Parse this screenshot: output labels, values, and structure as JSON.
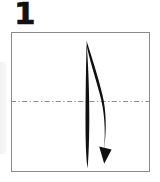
{
  "figure": {
    "kind": "origami-instruction-diagram",
    "step_number": "1",
    "canvas": {
      "width": 160,
      "height": 182,
      "background": "#ffffff"
    },
    "colors": {
      "ink": "#111111",
      "paper_border": "#8b8b8b",
      "crease_line": "#8d8d8d",
      "paper_fill": "#ffffff",
      "margin_shade": "#f1f1f1"
    },
    "paper": {
      "name": "square-sheet",
      "shape": "square",
      "x": 11,
      "y": 32,
      "width": 139,
      "height": 140
    },
    "crease": {
      "name": "horizontal-valley-fold-line",
      "style": "dash-dot",
      "orientation": "horizontal",
      "x1": 11,
      "y1": 101,
      "x2": 150,
      "y2": 101
    },
    "arrow": {
      "name": "fold-direction-arrow",
      "style": "curved-tapered-with-solid-head",
      "direction": "downward",
      "start": {
        "x": 86,
        "y": 40
      },
      "end": {
        "x": 105,
        "y": 163
      },
      "bulge": "rightward"
    }
  }
}
